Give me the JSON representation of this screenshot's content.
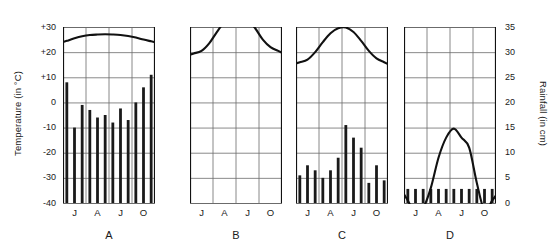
{
  "figure": {
    "left_axis_title": "Temperature (in °C)",
    "right_axis_title": "Rainfall (in cm)",
    "left_ticks": [
      "+30",
      "+20",
      "+10",
      "0",
      "-10",
      "-20",
      "-30",
      "-40"
    ],
    "right_ticks": [
      "35",
      "30",
      "25",
      "20",
      "15",
      "10",
      "5",
      "0"
    ],
    "month_ticks": [
      "J",
      "A",
      "J",
      "O"
    ],
    "panel_letters": [
      "A",
      "B",
      "C",
      "D"
    ],
    "temp_color": "#111111",
    "bar_color": "#1a1a1a",
    "grid_color": "#6b6b6b",
    "axis_color": "#111111"
  },
  "chart_data": [
    {
      "type": "line",
      "title": "A",
      "xlabel": "",
      "ylabel": "Temperature (in °C)",
      "ylim": [
        -40,
        30
      ],
      "y2lim": [
        0,
        35
      ],
      "x": [
        "J",
        "F",
        "M",
        "A",
        "M",
        "J",
        "J",
        "A",
        "S",
        "O",
        "N",
        "D"
      ],
      "xticks": [
        "J",
        "A",
        "J",
        "O"
      ],
      "grid": true,
      "legend": "none",
      "series": [
        {
          "name": "Temperature",
          "unit": "°C",
          "axis": "left",
          "render": "curve",
          "values": [
            24.5,
            25.5,
            26.3,
            26.8,
            27.0,
            27.1,
            27.0,
            26.8,
            26.4,
            25.8,
            25.0,
            24.3
          ]
        },
        {
          "name": "Rainfall",
          "unit": "cm",
          "axis": "right",
          "render": "bars",
          "values": [
            24.0,
            15.0,
            19.5,
            18.5,
            17.0,
            17.5,
            16.0,
            18.8,
            16.5,
            20.0,
            23.0,
            25.5
          ]
        }
      ]
    },
    {
      "type": "line",
      "title": "B",
      "xlabel": "",
      "ylabel": "Temperature (in °C)",
      "ylim": [
        -40,
        30
      ],
      "y2lim": [
        0,
        35
      ],
      "x": [
        "J",
        "F",
        "M",
        "A",
        "M",
        "J",
        "J",
        "A",
        "S",
        "O",
        "N",
        "D"
      ],
      "xticks": [
        "J",
        "A",
        "J",
        "O"
      ],
      "grid": true,
      "legend": "none",
      "series": [
        {
          "name": "Temperature",
          "unit": "°C",
          "axis": "left",
          "render": "curve",
          "values": [
            19.5,
            20.5,
            23.5,
            28.0,
            32.0,
            34.0,
            34.3,
            33.0,
            29.5,
            25.0,
            22.0,
            20.5
          ]
        },
        {
          "name": "Rainfall",
          "unit": "cm",
          "axis": "right",
          "render": "bars",
          "values": [
            0,
            0,
            0,
            0,
            0,
            0,
            0,
            0,
            0,
            0,
            0,
            0
          ]
        }
      ]
    },
    {
      "type": "line",
      "title": "C",
      "xlabel": "",
      "ylabel": "Temperature (in °C)",
      "ylim": [
        -40,
        30
      ],
      "y2lim": [
        0,
        35
      ],
      "x": [
        "J",
        "F",
        "M",
        "A",
        "M",
        "J",
        "J",
        "A",
        "S",
        "O",
        "N",
        "D"
      ],
      "xticks": [
        "J",
        "A",
        "J",
        "O"
      ],
      "grid": true,
      "legend": "none",
      "series": [
        {
          "name": "Temperature",
          "unit": "°C",
          "axis": "left",
          "render": "curve",
          "values": [
            16.0,
            17.0,
            20.0,
            24.0,
            27.5,
            29.5,
            29.8,
            28.0,
            24.5,
            20.5,
            17.5,
            16.0
          ]
        },
        {
          "name": "Rainfall",
          "unit": "cm",
          "axis": "right",
          "render": "bars",
          "values": [
            5.5,
            7.5,
            6.5,
            5.0,
            6.5,
            9.0,
            15.5,
            13.0,
            11.0,
            4.0,
            7.5,
            4.5
          ]
        }
      ]
    },
    {
      "type": "line",
      "title": "D",
      "xlabel": "",
      "ylabel": "Rainfall (in cm)",
      "ylim": [
        -40,
        30
      ],
      "y2lim": [
        0,
        35
      ],
      "x": [
        "J",
        "F",
        "M",
        "A",
        "M",
        "J",
        "J",
        "A",
        "S",
        "O",
        "N",
        "D"
      ],
      "xticks": [
        "J",
        "A",
        "J",
        "O"
      ],
      "grid": true,
      "legend": "none",
      "series": [
        {
          "name": "Rainfall",
          "unit": "cm",
          "axis": "right",
          "render": "curve",
          "values": [
            0.5,
            -2.0,
            -1.0,
            3.0,
            9.0,
            13.0,
            14.8,
            13.0,
            11.0,
            4.0,
            -1.5,
            0.5
          ]
        },
        {
          "name": "Temperature",
          "unit": "°C",
          "axis": "right",
          "render": "bars",
          "values": [
            2.8,
            2.8,
            2.8,
            2.8,
            2.8,
            2.8,
            2.8,
            2.8,
            2.8,
            2.8,
            2.8,
            2.8
          ]
        }
      ]
    }
  ]
}
